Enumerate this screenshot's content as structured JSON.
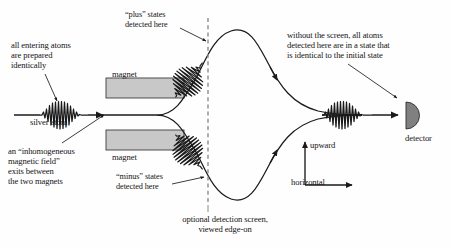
{
  "figure": {
    "type": "stern-gerlach-apparatus-diagram",
    "background_color": "#fefefe",
    "ink_color": "#1a1a1a",
    "magnet_fill_color": "#c8c8c8",
    "detector_fill_color": "#808080",
    "screen_line_color": "#8c8c8c"
  },
  "labels": {
    "entering_atoms": "all entering atoms\nare prepared\nidentically",
    "silver_atom": "silver atom",
    "inhomogeneous_field": "an “inhomogeneous\nmagnetic field”\nexits between\nthe two magnets",
    "magnet_top": "magnet",
    "magnet_bottom": "magnet",
    "plus_states": "“plus” states\ndetected here",
    "minus_states": "“minus” states\ndetected here",
    "detection_screen": "optional detection screen,\nviewed edge-on",
    "without_screen": "without the screen, all atoms\ndetected here are in a state that\nis identical to the initial state",
    "axis_upward": "upward",
    "axis_horizontal": "horizontal",
    "detector": "detector"
  },
  "components": {
    "magnet_top_rect": {
      "x": 106,
      "y": 78,
      "width": 78,
      "height": 20
    },
    "magnet_bottom_rect": {
      "x": 106,
      "y": 130,
      "width": 78,
      "height": 20
    },
    "detection_screen_line": {
      "x": 208,
      "y_top": 18,
      "y_bottom": 205,
      "style": "dashed"
    },
    "detector_shape": {
      "x": 415,
      "y": 116,
      "radius": 13,
      "shape": "half-disc"
    },
    "incoming_beam_y": 115,
    "wavepackets": [
      {
        "name": "incoming-wavepacket",
        "cx": 60,
        "cy": 115,
        "angle_deg": 0
      },
      {
        "name": "plus-branch-wavepacket",
        "cx": 189,
        "cy": 80,
        "angle_deg": -52
      },
      {
        "name": "minus-branch-wavepacket",
        "cx": 189,
        "cy": 152,
        "angle_deg": 52
      },
      {
        "name": "outgoing-wavepacket",
        "cx": 345,
        "cy": 115,
        "angle_deg": 0
      }
    ],
    "axes_origin": {
      "x": 305,
      "y": 185
    }
  }
}
